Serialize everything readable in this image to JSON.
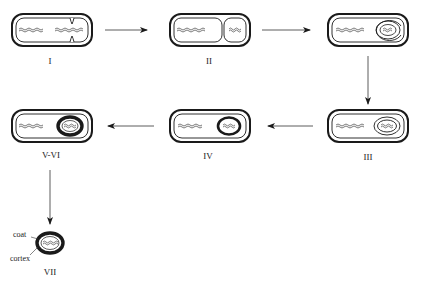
{
  "diagram": {
    "type": "sporulation-stages",
    "stages": [
      {
        "id": "I",
        "label": "I"
      },
      {
        "id": "II",
        "label": "II"
      },
      {
        "id": "III",
        "label": "III"
      },
      {
        "id": "IV",
        "label": "IV"
      },
      {
        "id": "V-VI",
        "label": "V-VI"
      },
      {
        "id": "VII",
        "label": "VII"
      }
    ],
    "annotations": {
      "coat": "coat",
      "cortex": "cortex"
    },
    "flow": [
      "I",
      "II",
      "III",
      "IV",
      "V-VI",
      "VII"
    ],
    "colors": {
      "stroke": "#1a1a1a",
      "background": "#ffffff"
    }
  }
}
